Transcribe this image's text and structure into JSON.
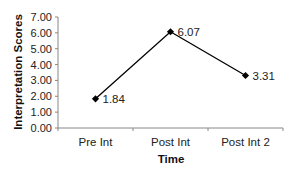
{
  "chart_data": {
    "type": "line",
    "title": "",
    "xlabel": "Time",
    "ylabel": "Interpretation Scores",
    "categories": [
      "Pre Int",
      "Post Int",
      "Post Int 2"
    ],
    "series": [
      {
        "name": "Interpretation Scores",
        "values": [
          1.84,
          6.07,
          3.31
        ],
        "data_labels": [
          "1.84",
          "6.07",
          "3.31"
        ],
        "marker": "diamond",
        "color": "#000000"
      }
    ],
    "ylim": [
      0,
      7
    ],
    "yticks": [
      0,
      1,
      2,
      3,
      4,
      5,
      6,
      7
    ],
    "ytick_labels": [
      "0.00",
      "1.00",
      "2.00",
      "3.00",
      "4.00",
      "5.00",
      "6.00",
      "7.00"
    ],
    "grid": false,
    "legend": null
  },
  "colors": {
    "line": "#000000",
    "axis": "#888888",
    "text": "#222222",
    "background": "#ffffff"
  }
}
